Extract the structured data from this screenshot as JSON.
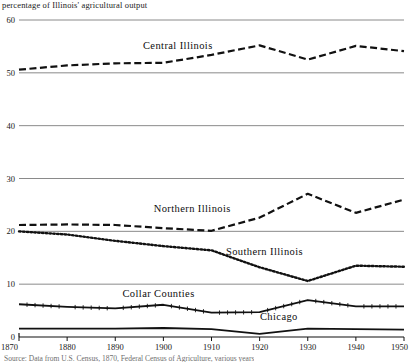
{
  "chart_data": {
    "type": "line",
    "title": "percentage of Illinois' agricultural output",
    "xlabel": "",
    "ylabel": "",
    "x": [
      1870,
      1880,
      1890,
      1900,
      1910,
      1920,
      1930,
      1940,
      1950
    ],
    "xlim": [
      1870,
      1950
    ],
    "ylim": [
      0,
      60
    ],
    "xticks": [
      "1870",
      "1880",
      "1890",
      "1900",
      "1910",
      "1920",
      "1930",
      "1940",
      "1950"
    ],
    "yticks": [
      "0",
      "10",
      "20",
      "30",
      "40",
      "50",
      "60"
    ],
    "grid": true,
    "legend_position": "inline-labels",
    "series": [
      {
        "name": "Central Illinois",
        "style": "dashed",
        "values": [
          50.6,
          51.4,
          51.8,
          51.9,
          53.4,
          55.2,
          52.5,
          55.1,
          54.1
        ],
        "label_x": 1903,
        "label_y": 54.6
      },
      {
        "name": "Northern Illinois",
        "style": "dashed",
        "values": [
          21.2,
          21.3,
          21.2,
          20.6,
          20.1,
          22.6,
          27.1,
          23.5,
          26.0
        ],
        "label_x": 1906,
        "label_y": 23.6
      },
      {
        "name": "Southern Illinois",
        "style": "dotted",
        "values": [
          20.0,
          19.4,
          18.2,
          17.2,
          16.4,
          13.2,
          10.6,
          13.5,
          13.3
        ],
        "label_x": 1921,
        "label_y": 15.5
      },
      {
        "name": "Collar Counties",
        "style": "solid-ticked",
        "values": [
          6.2,
          5.7,
          5.4,
          6.1,
          4.6,
          4.7,
          7.0,
          5.8,
          5.8
        ],
        "label_x": 1899,
        "label_y": 7.6
      },
      {
        "name": "Chicago",
        "style": "solid",
        "values": [
          1.6,
          1.6,
          1.6,
          1.7,
          1.5,
          0.6,
          1.6,
          1.5,
          1.4
        ],
        "label_x": 1924,
        "label_y": 3.3
      }
    ],
    "colors": {
      "line": "#111111",
      "gridline": "#8a8a8a",
      "axis": "#101010",
      "text": "#141414",
      "background": "#ffffff"
    }
  },
  "source": {
    "text": "Source: Data from U.S. Census, 1870, Federal Census of Agriculture, various years"
  }
}
